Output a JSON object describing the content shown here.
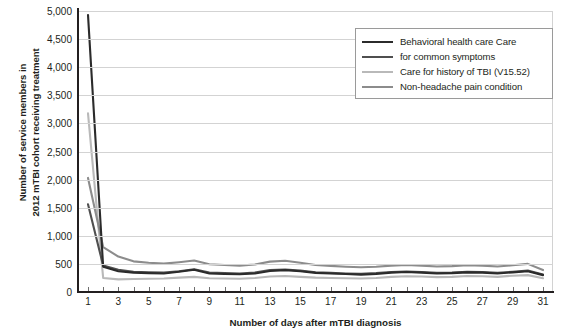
{
  "chart_data": {
    "type": "line",
    "title": "",
    "xlabel": "Number of days after mTBI diagnosis",
    "ylabel": "Number of service members in\n2012 mTBI cohort receiving treatment",
    "xlim": [
      1,
      31
    ],
    "ylim": [
      0,
      5000
    ],
    "ytick_step": 500,
    "grid": true,
    "legend_position": "top-right",
    "ytick_labels": [
      "0",
      "500",
      "1,000",
      "1,500",
      "2,000",
      "2,500",
      "3,000",
      "3,500",
      "4,000",
      "4,500",
      "5,000"
    ],
    "ytick_values": [
      0,
      500,
      1000,
      1500,
      2000,
      2500,
      3000,
      3500,
      4000,
      4500,
      5000
    ],
    "xtick_values": [
      1,
      2,
      3,
      4,
      5,
      6,
      7,
      8,
      9,
      10,
      11,
      12,
      13,
      14,
      15,
      16,
      17,
      18,
      19,
      20,
      21,
      22,
      23,
      24,
      25,
      26,
      27,
      28,
      29,
      30,
      31
    ],
    "xtick_labels": [
      "1",
      "3",
      "5",
      "7",
      "9",
      "11",
      "13",
      "15",
      "17",
      "19",
      "21",
      "23",
      "25",
      "27",
      "29",
      "31"
    ],
    "xtick_labeled_values": [
      1,
      3,
      5,
      7,
      9,
      11,
      13,
      15,
      17,
      19,
      21,
      23,
      25,
      27,
      29,
      31
    ],
    "x": [
      1,
      2,
      3,
      4,
      5,
      6,
      7,
      8,
      9,
      10,
      11,
      12,
      13,
      14,
      15,
      16,
      17,
      18,
      19,
      20,
      21,
      22,
      23,
      24,
      25,
      26,
      27,
      28,
      29,
      30,
      31
    ],
    "series": [
      {
        "name": "Behavioral health care",
        "legend_label": "Behavioral health care Care",
        "color": "#2b2b2b",
        "width": 2.1,
        "values": [
          4930,
          450,
          370,
          345,
          335,
          330,
          360,
          395,
          330,
          320,
          315,
          330,
          375,
          390,
          370,
          340,
          330,
          320,
          310,
          320,
          345,
          355,
          345,
          330,
          335,
          350,
          345,
          330,
          350,
          370,
          300
        ]
      },
      {
        "name": "Care for common symptoms",
        "legend_label": "for common symptoms",
        "color": "#4f4f4f",
        "width": 2.1,
        "values": [
          1560,
          470,
          395,
          360,
          350,
          345,
          370,
          405,
          345,
          335,
          330,
          345,
          390,
          400,
          380,
          350,
          340,
          330,
          325,
          335,
          355,
          365,
          355,
          340,
          345,
          360,
          355,
          340,
          360,
          380,
          310
        ]
      },
      {
        "name": "Care for history of TBI (V15.52)",
        "legend_label": "Care for history of TBI (V15.52)",
        "color": "#b9b9b9",
        "width": 2.1,
        "values": [
          3180,
          250,
          225,
          230,
          235,
          240,
          255,
          270,
          245,
          240,
          235,
          250,
          275,
          285,
          270,
          255,
          250,
          245,
          240,
          250,
          270,
          280,
          275,
          265,
          270,
          285,
          280,
          270,
          290,
          300,
          245
        ]
      },
      {
        "name": "Non-headache pain condition",
        "legend_label": "Non-headache pain condition",
        "color": "#8c8c8c",
        "width": 2.1,
        "values": [
          2030,
          800,
          630,
          545,
          520,
          505,
          530,
          560,
          495,
          480,
          470,
          490,
          540,
          555,
          520,
          480,
          465,
          450,
          440,
          450,
          470,
          480,
          470,
          455,
          460,
          475,
          470,
          455,
          475,
          500,
          390
        ]
      }
    ]
  },
  "legend": {
    "items": [
      {
        "label": "Behavioral health care Care",
        "color": "#2b2b2b"
      },
      {
        "label": "for common symptoms",
        "color": "#4f4f4f"
      },
      {
        "label": "Care for history of TBI (V15.52)",
        "color": "#b9b9b9"
      },
      {
        "label": "Non-headache pain condition",
        "color": "#8c8c8c"
      }
    ]
  },
  "axes": {
    "y_title": "Number of service members in\n2012 mTBI cohort receiving treatment",
    "x_title": "Number of days after mTBI diagnosis"
  },
  "colors": {
    "axis": "#231f20",
    "grid": "#d3d3d3",
    "frame": "#d2d2d2",
    "legend_border": "#9a9a9a",
    "background": "#ffffff"
  }
}
